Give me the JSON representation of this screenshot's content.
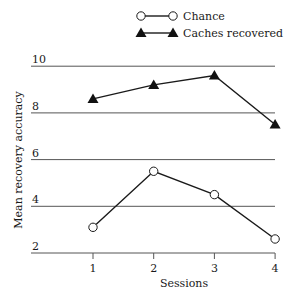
{
  "chart_data": {
    "type": "line",
    "title": "",
    "xlabel": "Sessions",
    "ylabel": "Mean recovery accuracy",
    "categories": [
      "1",
      "2",
      "3",
      "4"
    ],
    "x": [
      1,
      2,
      3,
      4
    ],
    "yticks": [
      2,
      4,
      6,
      8,
      10
    ],
    "ylim": [
      2,
      10
    ],
    "grid": "horizontal",
    "legend_position": "top-right",
    "series": [
      {
        "name": "Chance",
        "marker": "open-circle",
        "values": [
          3.1,
          5.5,
          4.5,
          2.6
        ]
      },
      {
        "name": "Caches recovered",
        "marker": "filled-triangle",
        "values": [
          8.6,
          9.2,
          9.6,
          7.5
        ]
      }
    ]
  },
  "legend": {
    "items": [
      {
        "label": "Chance",
        "icon": "open-circle-line-icon"
      },
      {
        "label": "Caches recovered",
        "icon": "filled-triangle-line-icon"
      }
    ]
  },
  "colors": {
    "line": "#1a1a1a",
    "grid": "#555555",
    "marker_fill_open": "#ffffff",
    "marker_fill_solid": "#111111"
  }
}
